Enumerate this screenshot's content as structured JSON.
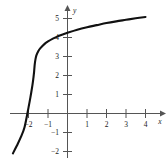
{
  "chart_data": {
    "type": "line",
    "title": "",
    "subtitle": "",
    "xlabel": "x",
    "ylabel": "y",
    "xlim": [
      -3.1,
      5.0
    ],
    "ylim": [
      -2.4,
      5.9
    ],
    "grid": false,
    "legend": null,
    "annotations": [],
    "x_ticks": [
      -2,
      -1,
      1,
      2,
      3,
      4
    ],
    "x_tick_labels": [
      "−2",
      "−1",
      "1",
      "2",
      "3",
      "4"
    ],
    "y_ticks": [
      -2,
      -1,
      1,
      2,
      3,
      4,
      5
    ],
    "y_tick_labels": [
      "−2",
      "−1",
      "1",
      "2",
      "3",
      "4",
      "5"
    ],
    "series": [
      {
        "name": "cube-root curve",
        "color": "#111111",
        "x": [
          -2.8,
          -2.6,
          -2.4,
          -2.2,
          -2.0,
          -1.9,
          -1.8,
          -1.75,
          -1.72,
          -1.7,
          -1.68,
          -1.65,
          -1.6,
          -1.5,
          -1.4,
          -1.2,
          -1.0,
          -0.75,
          -0.5,
          -0.25,
          0.0,
          0.5,
          1.0,
          1.5,
          2.0,
          2.5,
          3.0,
          3.5,
          4.0
        ],
        "y": [
          -2.1,
          -1.7,
          -1.26,
          -0.71,
          0.31,
          0.86,
          1.48,
          1.86,
          2.12,
          2.36,
          2.58,
          2.81,
          3.05,
          3.28,
          3.43,
          3.64,
          3.79,
          3.94,
          4.06,
          4.16,
          4.25,
          4.41,
          4.54,
          4.65,
          4.76,
          4.85,
          4.93,
          5.01,
          5.08
        ]
      }
    ],
    "axis_arrows": [
      "x-positive",
      "y-positive"
    ],
    "origin_label": ""
  },
  "figure": {
    "axis_color": "#555555",
    "curve_color": "#111111",
    "background": "#ffffff"
  }
}
